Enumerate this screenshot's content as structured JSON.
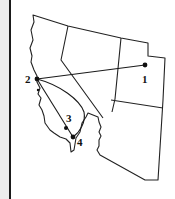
{
  "map": {
    "region": "Western United States (CA, NV, UT, AZ outlines)",
    "points": [
      {
        "id": "1",
        "label": "1",
        "x": 145,
        "y": 65
      },
      {
        "id": "2",
        "label": "2",
        "x": 37,
        "y": 79
      },
      {
        "id": "3",
        "label": "3",
        "x": 66,
        "y": 128
      },
      {
        "id": "4",
        "label": "4",
        "x": 73,
        "y": 137
      }
    ],
    "routes": [
      {
        "from": "2",
        "to": "1",
        "shape": "straight"
      },
      {
        "from": "2",
        "to": "4",
        "shape": "straight"
      },
      {
        "from": "2",
        "to": "4",
        "shape": "curved-inland"
      }
    ],
    "colors": {
      "line": "#222222",
      "background": "#ffffff",
      "strip": "#ececec"
    }
  }
}
